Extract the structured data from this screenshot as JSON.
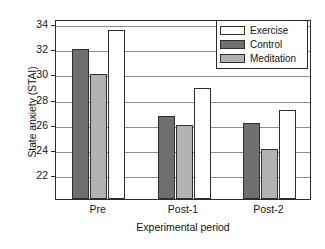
{
  "chart_data": {
    "type": "bar",
    "title": "",
    "xlabel": "Experimental period",
    "ylabel": "State anxiety (STAI)",
    "categories": [
      "Pre",
      "Post-1",
      "Post-2"
    ],
    "series": [
      {
        "name": "Exercise",
        "values": [
          33.5,
          28.9,
          27.2
        ],
        "color": "#ffffff"
      },
      {
        "name": "Control",
        "values": [
          32.0,
          26.7,
          26.1
        ],
        "color": "#6f6f6f"
      },
      {
        "name": "Meditation",
        "values": [
          30.0,
          26.0,
          24.1
        ],
        "color": "#b2b2b2"
      }
    ],
    "bar_order_in_group": [
      "Control",
      "Meditation",
      "Exercise"
    ],
    "ylim": [
      20.1,
      34.4
    ],
    "yticks": [
      22,
      24,
      26,
      28,
      30,
      32,
      34
    ],
    "ytick_labels": [
      "22",
      "24",
      "26",
      "28",
      "30",
      "32",
      "34"
    ],
    "grid": "horizontal",
    "legend_position": "top-right",
    "legend_entries": [
      "Exercise",
      "Control",
      "Meditation"
    ]
  },
  "axis": {
    "y_title": "State anxiety (STAI)",
    "x_title": "Experimental period"
  }
}
